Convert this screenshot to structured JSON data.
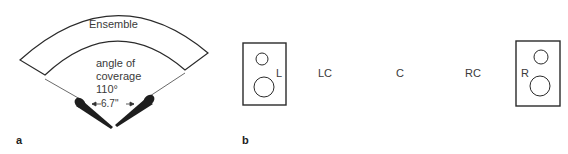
{
  "panel_a": {
    "label": "a",
    "ensemble_label": "Ensemble",
    "coverage_line1": "angle of",
    "coverage_line2": "coverage",
    "coverage_angle": "110°",
    "spacing": "6.7\""
  },
  "panel_b": {
    "label": "b",
    "positions": [
      "L",
      "LC",
      "C",
      "RC",
      "R"
    ]
  },
  "colors": {
    "stroke": "#2a2a2a",
    "text": "#3a3a3a"
  }
}
